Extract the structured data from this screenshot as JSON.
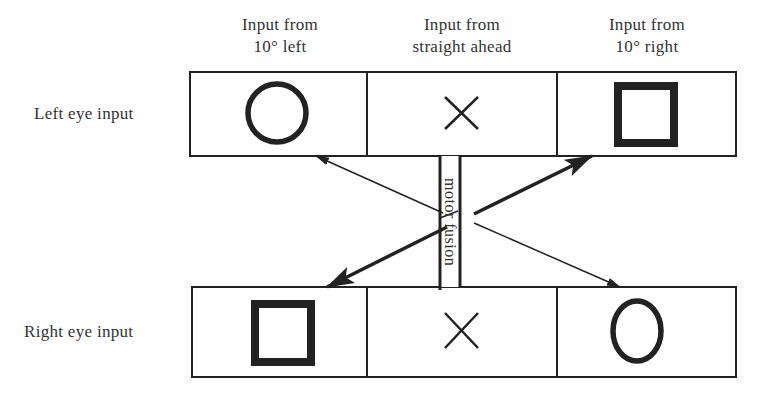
{
  "columns": [
    {
      "line1": "Input from",
      "line2": "10° left"
    },
    {
      "line1": "Input from",
      "line2": "straight ahead"
    },
    {
      "line1": "Input from",
      "line2": "10° right"
    }
  ],
  "rows": [
    {
      "label": "Left eye input",
      "cells": [
        "circle-icon",
        "x-icon",
        "square-icon"
      ]
    },
    {
      "label": "Right eye input",
      "cells": [
        "square-icon",
        "x-icon",
        "circle-icon"
      ]
    }
  ],
  "center": {
    "label": "motor fusion"
  },
  "arrows": [
    {
      "from": "right-eye-10-right",
      "to": "left-eye-10-left",
      "weight": "thin"
    },
    {
      "from": "left-eye-10-left",
      "to": "right-eye-10-right",
      "weight": "thin"
    },
    {
      "from": "center",
      "to": "left-eye-10-right",
      "weight": "thick"
    },
    {
      "from": "center",
      "to": "right-eye-10-left",
      "weight": "thick"
    }
  ],
  "colors": {
    "stroke": "#222222",
    "text": "#333333",
    "background": "#ffffff"
  }
}
